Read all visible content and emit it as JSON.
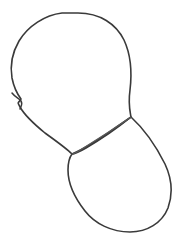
{
  "document": {
    "title": "Character construction sketch",
    "type": "line-drawing",
    "description": "Two overlapping outlined blobs forming a head shape and a larger rounded body shape below-right, drawn as a continuous pencil-style contour"
  },
  "canvas": {
    "width": 175,
    "height": 243,
    "background_color": "#ffffff"
  },
  "style": {
    "stroke_color": "#3a3a3a",
    "stroke_color_light": "#5a5a5a",
    "stroke_width": 1.6,
    "stroke_width_thin": 1.2,
    "fill": "none"
  },
  "shapes": [
    {
      "name": "head-outline",
      "label": "Head outline",
      "kind": "closed-blob",
      "bounds": {
        "x": 11,
        "y": 13,
        "width": 120,
        "height": 142
      },
      "path": "M 78 13 C 100 13 116 24 124 40 C 131 55 132 73 130 90 C 128 104 130 111 131 117 C 120 126 100 140 86 148 C 79 152 74 154 72 154 C 66 148 56 141 45 133 C 34 124 25 116 20 107 C 17 101 18 104 21 99 C 18 95 14 88 12 78 C 10 66 12 53 19 41 C 28 26 45 15 62 13 C 67 13 73 13 78 13 Z"
    },
    {
      "name": "ear-notch",
      "label": "Ear / jaw notch on left contour",
      "kind": "detail",
      "bounds": {
        "x": 12,
        "y": 93,
        "width": 14,
        "height": 20
      },
      "path": "M 12 93 C 15 97 19 98 21 101 C 23 104 21 106 20 109"
    },
    {
      "name": "body-outline",
      "label": "Body / muzzle outline",
      "kind": "closed-blob",
      "bounds": {
        "x": 67,
        "y": 117,
        "width": 105,
        "height": 116
      },
      "path": "M 131 117 C 143 128 156 146 165 164 C 172 179 173 194 168 208 C 162 223 147 232 130 232 C 112 232 95 224 85 211 C 74 197 68 182 68 170 C 68 163 69 158 72 154 C 82 150 104 136 118 126 C 124 122 128 119 131 117 Z"
    },
    {
      "name": "jaw-line",
      "label": "Chin / jaw connecting line",
      "kind": "open-curve",
      "bounds": {
        "x": 72,
        "y": 117,
        "width": 59,
        "height": 38
      },
      "path": "M 131 117 C 118 126 98 139 85 147 C 79 151 74 154 72 154"
    }
  ],
  "key_points": [
    {
      "name": "head-top",
      "x": 78,
      "y": 13
    },
    {
      "name": "head-left",
      "x": 11,
      "y": 70
    },
    {
      "name": "head-right",
      "x": 131,
      "y": 88
    },
    {
      "name": "junction-right",
      "x": 131,
      "y": 117
    },
    {
      "name": "junction-left",
      "x": 72,
      "y": 154
    },
    {
      "name": "body-left",
      "x": 68,
      "y": 178
    },
    {
      "name": "body-right",
      "x": 172,
      "y": 192
    },
    {
      "name": "body-bottom",
      "x": 128,
      "y": 232
    }
  ]
}
